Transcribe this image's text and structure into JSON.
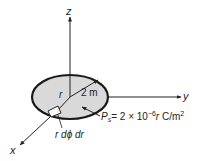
{
  "diagram": {
    "axes": {
      "z_label": "z",
      "y_label": "y",
      "x_label": "x"
    },
    "disk": {
      "fill_color": "#d9d9d9",
      "stroke_color": "#1a1a1a",
      "radius_symbol": "r",
      "radius_value": "2 m"
    },
    "charge_density": {
      "symbol": "P",
      "subscript": "s",
      "expression": "= 2 × 10",
      "exponent": "−6",
      "variable": "r",
      "units": " C/m",
      "units_exponent": "2"
    },
    "element": {
      "label": "r dϕ dr"
    }
  }
}
